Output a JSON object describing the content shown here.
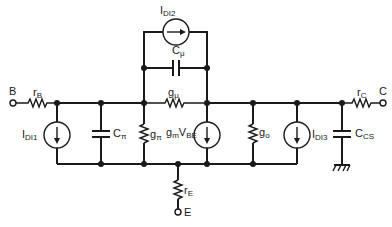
{
  "diagram": {
    "type": "circuit-schematic",
    "terminals": {
      "base": "B",
      "collector": "C",
      "emitter": "E"
    },
    "components": {
      "rB": {
        "main": "r",
        "sub": "B"
      },
      "rC": {
        "main": "r",
        "sub": "C"
      },
      "rE": {
        "main": "r",
        "sub": "E"
      },
      "IDI1": {
        "main": "I",
        "sub": "DI1"
      },
      "IDI2": {
        "main": "I",
        "sub": "DI2"
      },
      "IDI3": {
        "main": "I",
        "sub": "DI3"
      },
      "Cpi": {
        "main": "C",
        "sub": "π"
      },
      "Cmu": {
        "main": "C",
        "sub": "μ"
      },
      "Ccs": {
        "main": "C",
        "sub": "CS"
      },
      "gpi": {
        "main": "g",
        "sub": "π"
      },
      "gmu": {
        "main": "g",
        "sub": "μ"
      },
      "go": {
        "main": "g",
        "sub": "o"
      },
      "gmVbe": {
        "main": "g",
        "sub": "m",
        "main2": "V",
        "sub2": "BE"
      }
    },
    "colors": {
      "line": "#1a1a1a",
      "background": "#ffffff"
    }
  }
}
